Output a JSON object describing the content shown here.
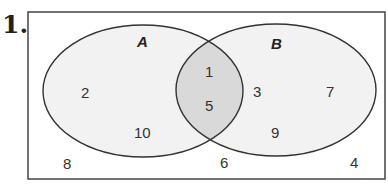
{
  "problem_number": "1.",
  "diagram": {
    "type": "venn",
    "sets": [
      {
        "name": "A",
        "only": [
          "2",
          "10"
        ]
      },
      {
        "name": "B",
        "only": [
          "3",
          "7",
          "9"
        ]
      }
    ],
    "intersection": [
      "1",
      "5"
    ],
    "outside": [
      "8",
      "6",
      "4"
    ],
    "colors": {
      "ellipse_fill": "#f2f2f2",
      "intersection_fill": "#d9d9d9",
      "stroke": "#333333"
    }
  },
  "labels": {
    "A": "A",
    "B": "B",
    "a2": "2",
    "a10": "10",
    "i1": "1",
    "i5": "5",
    "b3": "3",
    "b7": "7",
    "b9": "9",
    "o8": "8",
    "o6": "6",
    "o4": "4"
  }
}
